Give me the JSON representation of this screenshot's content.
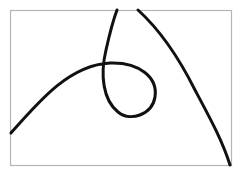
{
  "figure": {
    "background": "#ffffff",
    "frame_color": "#b5b5b5",
    "stroke_color": "#111111",
    "curves": [
      {
        "name": "loop-curve"
      },
      {
        "name": "arc-curve"
      }
    ]
  }
}
